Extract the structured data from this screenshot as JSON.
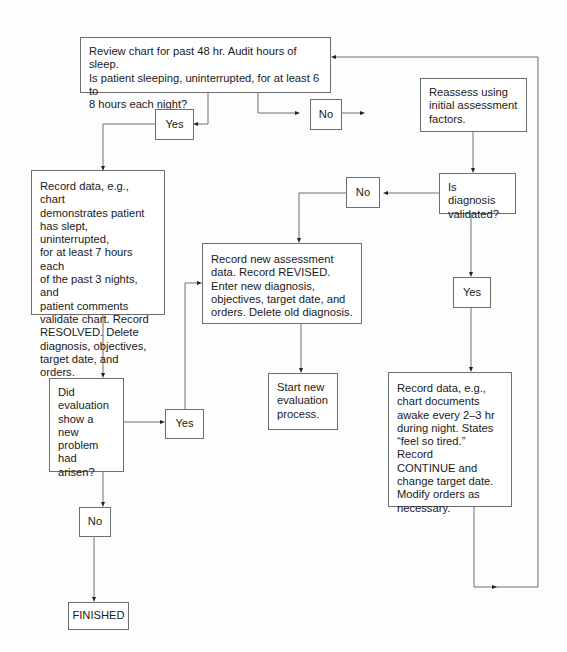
{
  "flowchart": {
    "nodes": {
      "review": {
        "text": "Review chart for past 48 hr. Audit hours of sleep.\nIs patient sleeping, uninterrupted, for at least 6 to\n8 hours each night?"
      },
      "yes_top": {
        "text": "Yes"
      },
      "no_top": {
        "text": "No"
      },
      "reassess": {
        "text": "Reassess using\ninitial assessment\nfactors."
      },
      "diagnosis_validated": {
        "text": "Is diagnosis\nvalidated?"
      },
      "no_diag": {
        "text": "No"
      },
      "yes_diag": {
        "text": "Yes"
      },
      "record_resolved": {
        "text": "Record data, e.g., chart\ndemonstrates patient\nhas slept, uninterrupted,\nfor at least 7 hours each\nof the past 3 nights, and\npatient comments\nvalidate chart. Record\nRESOLVED. Delete\ndiagnosis, objectives,\ntarget date, and orders."
      },
      "record_revised": {
        "text": "Record new assessment\ndata. Record REVISED.\nEnter new diagnosis,\nobjectives, target date, and\norders. Delete old diagnosis."
      },
      "new_problem": {
        "text": "Did\nevaluation\nshow a\nnew\nproblem\nhad arisen?"
      },
      "yes_new": {
        "text": "Yes"
      },
      "start_new": {
        "text": "Start new\nevaluation\nprocess."
      },
      "record_continue": {
        "text": "Record data, e.g.,\nchart documents\nawake every 2–3 hr\nduring night. States\n“feel so tired.” Record\nCONTINUE and\nchange target date.\nModify orders as\nnecessary."
      },
      "no_new": {
        "text": "No"
      },
      "finished": {
        "text": "FINISHED"
      }
    }
  }
}
